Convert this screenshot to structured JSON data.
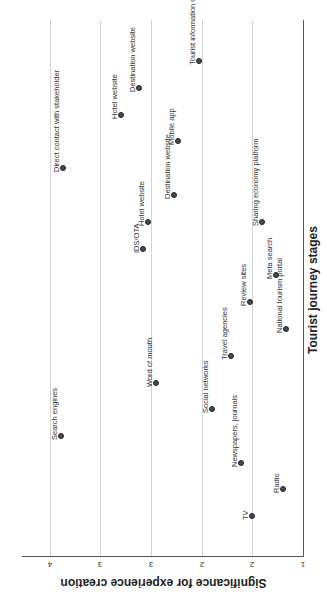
{
  "chart_data": {
    "type": "scatter",
    "title": "",
    "orientation": "rotated 90° (stages run vertically, significance horizontally, axes labels rotated)",
    "xlabel": "Significance for experience creation",
    "ylabel": "Tourist journey stages",
    "x_ticks": [
      "4",
      "3",
      "3",
      "2",
      "2",
      "1"
    ],
    "x_tick_values": [
      4,
      3.5,
      3,
      2.5,
      2,
      1.5
    ],
    "xlim": [
      1.5,
      4.2
    ],
    "grid": true,
    "legend": null,
    "points": [
      {
        "label": "TV",
        "significance": 2.0,
        "order": 1,
        "px": 252,
        "py": 516
      },
      {
        "label": "Radio",
        "significance": 1.69,
        "order": 2,
        "px": 283,
        "py": 489
      },
      {
        "label": "Newspapers, journals",
        "significance": 2.11,
        "order": 3,
        "px": 241,
        "py": 463
      },
      {
        "label": "Search engines",
        "significance": 3.89,
        "order": 4,
        "px": 61,
        "py": 436
      },
      {
        "label": "Social networks",
        "significance": 2.4,
        "order": 5,
        "px": 212,
        "py": 409
      },
      {
        "label": "Word of mouth",
        "significance": 2.95,
        "order": 6,
        "px": 156,
        "py": 383
      },
      {
        "label": "Travel agencies",
        "significance": 2.21,
        "order": 7,
        "px": 231,
        "py": 356
      },
      {
        "label": "National tourism portal",
        "significance": 1.66,
        "order": 8,
        "px": 286,
        "py": 329
      },
      {
        "label": "Review sites",
        "significance": 2.02,
        "order": 9,
        "px": 250,
        "py": 302
      },
      {
        "label": "Meta search",
        "significance": 1.76,
        "order": 10,
        "px": 276,
        "py": 275
      },
      {
        "label": "IDS/OTA",
        "significance": 3.07,
        "order": 11,
        "px": 143,
        "py": 249
      },
      {
        "label": "Hotel website",
        "significance": 3.03,
        "order": 12,
        "px": 148,
        "py": 222
      },
      {
        "label": "Sharing economy platform",
        "significance": 1.9,
        "order": 12,
        "px": 262,
        "py": 222
      },
      {
        "label": "Destination website",
        "significance": 2.78,
        "order": 13,
        "px": 174,
        "py": 195
      },
      {
        "label": "Direct contact with stakeholder",
        "significance": 3.87,
        "order": 14,
        "px": 63,
        "py": 168
      },
      {
        "label": "Mobile app",
        "significance": 2.26,
        "order": 15,
        "px": 178,
        "py": 141
      },
      {
        "label": "Hotel website",
        "significance": 3.29,
        "order": 16,
        "px": 121,
        "py": 115
      },
      {
        "label": "Destination website",
        "significance": 2.81,
        "order": 17,
        "px": 139,
        "py": 88
      },
      {
        "label": "Tourist information office",
        "significance": 2.51,
        "order": 18,
        "px": 199,
        "py": 61
      }
    ]
  },
  "axes": {
    "x_title": "Significance for experience creation",
    "y_title": "Tourist journey stages",
    "ticks": [
      {
        "label": "4",
        "x": 50
      },
      {
        "label": "3",
        "x": 100
      },
      {
        "label": "3",
        "x": 151
      },
      {
        "label": "2",
        "x": 202
      },
      {
        "label": "2",
        "x": 252
      },
      {
        "label": "1",
        "x": 303
      }
    ]
  }
}
